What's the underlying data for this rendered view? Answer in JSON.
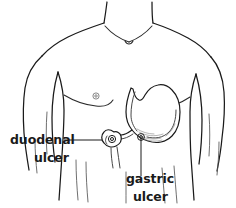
{
  "figure": {
    "background_color": "#ffffff",
    "line_color": "#1a1a1a",
    "width": 236,
    "height": 208
  },
  "labels": [
    {
      "id": "duodenal-ulcer",
      "line1": "duodenal",
      "line2": "ulcer",
      "x": 10,
      "y_line1": 144,
      "y_line2": 162,
      "anchor": "start",
      "color": "#1a1a1a"
    },
    {
      "id": "gastric-ulcer",
      "line1": "gastric",
      "line2": "ulcer",
      "x": 126,
      "y_line1": 183,
      "y_line2": 201,
      "anchor": "start",
      "color": "#1a1a1a"
    }
  ],
  "anatomy": {
    "torso_name": "human-torso-outline",
    "organ_name": "stomach-and-duodenum",
    "parts": [
      "neck",
      "shoulders",
      "clavicle",
      "arms",
      "chest",
      "nipples",
      "abdomen",
      "esophagus",
      "stomach-fundus",
      "stomach-body",
      "greater-curvature",
      "lesser-curvature",
      "pylorus",
      "duodenum"
    ]
  },
  "leaders": [
    {
      "id": "duodenal-leader",
      "description": "horizontal line from duodenal ulcer label to duodenal bulb"
    },
    {
      "id": "gastric-leader",
      "description": "vertical line from stomach greater curvature down to gastric ulcer label"
    }
  ]
}
